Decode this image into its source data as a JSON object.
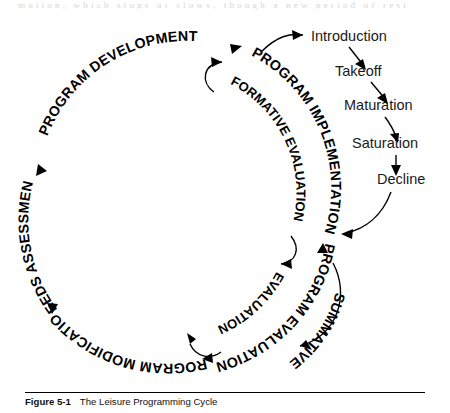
{
  "page": {
    "running_text_remnant": "motion, which stops or slows, though a new period of rest",
    "background_color": "#ffffff",
    "ink_color": "#000000"
  },
  "caption": {
    "figure_number": "Figure 5-1",
    "title": "The Leisure Programming Cycle"
  },
  "diagram": {
    "title": "The Leisure Programming Cycle",
    "type": "circular-cycle-diagram",
    "cycle_labels": [
      "NEEDS ASSESSMENT",
      "PROGRAM DEVELOPMENT",
      "PROGRAM IMPLEMENTATION",
      "PROGRAM EVALUATION",
      "PROGRAM MODIFICATION"
    ],
    "inner_labels": [
      "FORMATIVE EVALUATION",
      "EVALUATION",
      "SUMMATIVE EVALUATION"
    ],
    "stage_labels": [
      "Introduction",
      "Takeoff",
      "Maturation",
      "Saturation",
      "Decline"
    ],
    "arc_text": {
      "program_development": "PROGRAM DEVELOPMENT",
      "program_implementation": "PROGRAM IMPLEMENTATION",
      "formative_evaluation": "FORMATIVE EVALUATION",
      "program_evaluation": "PROGRAM EVALUATION",
      "summative_evaluation": "SUMMATIVE",
      "evaluation": "EVALUATION",
      "program_modification": "PROGRAM MODIFICATION",
      "needs_assessment": "NEEDS ASSESSMENT"
    },
    "stages": {
      "introduction": "Introduction",
      "takeoff": "Takeoff",
      "maturation": "Maturation",
      "saturation": "Saturation",
      "decline": "Decline"
    }
  }
}
